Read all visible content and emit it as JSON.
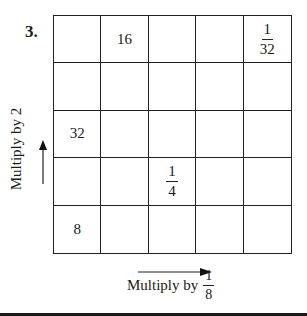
{
  "problem": {
    "number": "3."
  },
  "grid": {
    "rows": [
      [
        {
          "text": ""
        },
        {
          "text": "16"
        },
        {
          "text": ""
        },
        {
          "text": ""
        },
        {
          "num": "1",
          "den": "32"
        }
      ],
      [
        {
          "text": ""
        },
        {
          "text": ""
        },
        {
          "text": ""
        },
        {
          "text": ""
        },
        {
          "text": ""
        }
      ],
      [
        {
          "text": "32"
        },
        {
          "text": ""
        },
        {
          "text": ""
        },
        {
          "text": ""
        },
        {
          "text": ""
        }
      ],
      [
        {
          "text": ""
        },
        {
          "text": ""
        },
        {
          "num": "1",
          "den": "4"
        },
        {
          "text": ""
        },
        {
          "text": ""
        }
      ],
      [
        {
          "text": "8"
        },
        {
          "text": ""
        },
        {
          "text": ""
        },
        {
          "text": ""
        },
        {
          "text": ""
        }
      ]
    ]
  },
  "vertical_label": {
    "text": "Multiply by 2",
    "arrow_direction": "up"
  },
  "horizontal_label": {
    "prefix": "Multiply by",
    "fraction": {
      "num": "1",
      "den": "8"
    },
    "arrow_direction": "right"
  }
}
